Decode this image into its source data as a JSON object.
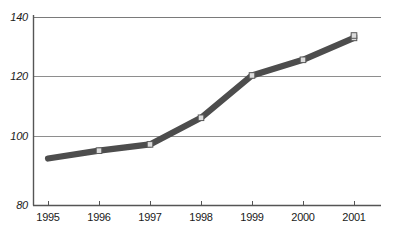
{
  "chart_data": {
    "type": "line",
    "title": "",
    "subtitle": "",
    "xlabel": "",
    "ylabel": "",
    "categories": [
      "1995",
      "1996",
      "1997",
      "1998",
      "1999",
      "2000",
      "2001"
    ],
    "x": [
      1995,
      1996,
      1997,
      1998,
      1999,
      2000,
      2001
    ],
    "values": [
      95,
      97.5,
      99.5,
      108,
      121.5,
      126.5,
      133.5
    ],
    "series": [
      {
        "name": "",
        "values": [
          95,
          97.5,
          99.5,
          108,
          121.5,
          126.5,
          133.5
        ]
      }
    ],
    "ylim": [
      80,
      140
    ],
    "xlim": [
      1995,
      2001
    ],
    "ytick_labels": [
      "140",
      "120",
      "100",
      "80"
    ],
    "ytick_values": [
      140,
      120,
      100,
      80
    ],
    "xtick_labels": [
      "1995",
      "1996",
      "1997",
      "1998",
      "1999",
      "2000",
      "2001"
    ],
    "grid": true,
    "grid_axis": "y",
    "legend": false,
    "legend_position": "none",
    "annotations": [],
    "colors": {
      "line": "#4d4d4d",
      "marker_face": "#d9d9d9",
      "marker_edge": "#595959",
      "grid": "#8c8c8c",
      "axis": "#4d4d4d",
      "text": "#1a1a1a",
      "background": "#ffffff"
    },
    "style": {
      "line_width": 6,
      "marker": "square",
      "marker_size": 5
    }
  },
  "axis": {
    "y_labels": [
      {
        "text": "140",
        "value": 140
      },
      {
        "text": "120",
        "value": 120
      },
      {
        "text": "100",
        "value": 100
      },
      {
        "text": "80",
        "value": 80
      }
    ],
    "x_labels": [
      {
        "text": "1995"
      },
      {
        "text": "1996"
      },
      {
        "text": "1997"
      },
      {
        "text": "1998"
      },
      {
        "text": "1999"
      },
      {
        "text": "2000"
      },
      {
        "text": "2001"
      }
    ]
  }
}
